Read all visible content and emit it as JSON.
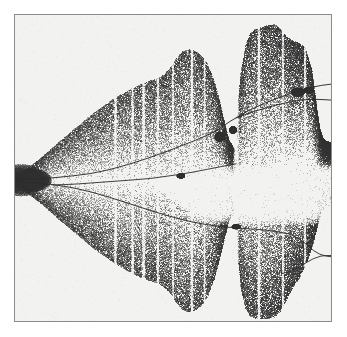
{
  "figure": {
    "kind": "bifurcation-diagram",
    "width_px": 347,
    "height_px": 337,
    "page_background": "#ffffff",
    "plot_background": "#f2f2f0",
    "frame_border_color": "#8a8a8a",
    "ink_color": "#2b2b2b",
    "title": "",
    "caption": ""
  },
  "chart_data": {
    "type": "scatter",
    "title": "",
    "subtitle": "",
    "xlabel": "",
    "ylabel": "",
    "xlim": [
      0,
      1
    ],
    "ylim": [
      0,
      1
    ],
    "grid": false,
    "legend": null,
    "axis_ticks_visible": false,
    "render": {
      "point_color": "#303030",
      "point_size_px": 1,
      "total_points": 150000,
      "seed": 20240607,
      "density_gamma": 1.35
    },
    "envelope": {
      "comment": "Upper and lower boundary of the chaotic band in normalized plot coords; x 0..1 left-to-right, y 0..1 top-to-bottom.",
      "upper": [
        [
          0.0,
          0.52
        ],
        [
          0.02,
          0.512
        ],
        [
          0.045,
          0.498
        ],
        [
          0.07,
          0.478
        ],
        [
          0.1,
          0.452
        ],
        [
          0.13,
          0.424
        ],
        [
          0.16,
          0.398
        ],
        [
          0.19,
          0.372
        ],
        [
          0.22,
          0.346
        ],
        [
          0.25,
          0.32
        ],
        [
          0.28,
          0.298
        ],
        [
          0.31,
          0.276
        ],
        [
          0.34,
          0.258
        ],
        [
          0.37,
          0.24
        ],
        [
          0.4,
          0.226
        ],
        [
          0.43,
          0.214
        ],
        [
          0.455,
          0.206
        ],
        [
          0.47,
          0.196
        ],
        [
          0.49,
          0.175
        ],
        [
          0.51,
          0.142
        ],
        [
          0.53,
          0.12
        ],
        [
          0.55,
          0.112
        ],
        [
          0.57,
          0.118
        ],
        [
          0.59,
          0.132
        ],
        [
          0.61,
          0.16
        ],
        [
          0.63,
          0.215
        ],
        [
          0.65,
          0.29
        ],
        [
          0.665,
          0.36
        ],
        [
          0.678,
          0.41
        ],
        [
          0.69,
          0.432
        ],
        [
          0.7,
          0.44
        ],
        [
          0.705,
          0.3
        ],
        [
          0.715,
          0.19
        ],
        [
          0.73,
          0.1
        ],
        [
          0.745,
          0.06
        ],
        [
          0.76,
          0.046
        ],
        [
          0.78,
          0.04
        ],
        [
          0.8,
          0.034
        ],
        [
          0.82,
          0.03
        ],
        [
          0.84,
          0.045
        ],
        [
          0.86,
          0.072
        ],
        [
          0.88,
          0.085
        ],
        [
          0.9,
          0.092
        ],
        [
          0.92,
          0.11
        ],
        [
          0.94,
          0.18
        ],
        [
          0.955,
          0.3
        ],
        [
          0.965,
          0.37
        ],
        [
          0.975,
          0.402
        ],
        [
          0.985,
          0.412
        ],
        [
          1.0,
          0.418
        ]
      ],
      "lower": [
        [
          0.0,
          0.56
        ],
        [
          0.02,
          0.57
        ],
        [
          0.045,
          0.586
        ],
        [
          0.07,
          0.606
        ],
        [
          0.1,
          0.632
        ],
        [
          0.13,
          0.66
        ],
        [
          0.16,
          0.686
        ],
        [
          0.19,
          0.712
        ],
        [
          0.22,
          0.738
        ],
        [
          0.25,
          0.764
        ],
        [
          0.28,
          0.786
        ],
        [
          0.31,
          0.808
        ],
        [
          0.34,
          0.826
        ],
        [
          0.37,
          0.844
        ],
        [
          0.4,
          0.858
        ],
        [
          0.43,
          0.87
        ],
        [
          0.455,
          0.878
        ],
        [
          0.47,
          0.888
        ],
        [
          0.49,
          0.908
        ],
        [
          0.51,
          0.94
        ],
        [
          0.53,
          0.962
        ],
        [
          0.55,
          0.972
        ],
        [
          0.57,
          0.966
        ],
        [
          0.59,
          0.95
        ],
        [
          0.61,
          0.92
        ],
        [
          0.63,
          0.866
        ],
        [
          0.65,
          0.79
        ],
        [
          0.665,
          0.722
        ],
        [
          0.678,
          0.672
        ],
        [
          0.69,
          0.65
        ],
        [
          0.7,
          0.642
        ],
        [
          0.705,
          0.78
        ],
        [
          0.715,
          0.89
        ],
        [
          0.73,
          0.96
        ],
        [
          0.745,
          0.984
        ],
        [
          0.76,
          0.992
        ],
        [
          0.78,
          0.994
        ],
        [
          0.8,
          0.992
        ],
        [
          0.82,
          0.988
        ],
        [
          0.84,
          0.97
        ],
        [
          0.86,
          0.93
        ],
        [
          0.88,
          0.89
        ],
        [
          0.9,
          0.86
        ],
        [
          0.92,
          0.82
        ],
        [
          0.94,
          0.76
        ],
        [
          0.955,
          0.7
        ],
        [
          0.965,
          0.66
        ],
        [
          0.975,
          0.638
        ],
        [
          0.985,
          0.628
        ],
        [
          1.0,
          0.622
        ]
      ]
    },
    "periodic_windows": [
      {
        "x": 0.318,
        "half_width": 0.0055,
        "strength": 0.94
      },
      {
        "x": 0.372,
        "half_width": 0.005,
        "strength": 0.9
      },
      {
        "x": 0.407,
        "half_width": 0.006,
        "strength": 0.92
      },
      {
        "x": 0.452,
        "half_width": 0.0048,
        "strength": 0.88
      },
      {
        "x": 0.5,
        "half_width": 0.0042,
        "strength": 0.86
      },
      {
        "x": 0.56,
        "half_width": 0.0055,
        "strength": 0.93
      },
      {
        "x": 0.6,
        "half_width": 0.004,
        "strength": 0.82
      },
      {
        "x": 0.7,
        "half_width": 0.011,
        "strength": 0.98
      },
      {
        "x": 0.772,
        "half_width": 0.0055,
        "strength": 0.93
      },
      {
        "x": 0.848,
        "half_width": 0.0045,
        "strength": 0.85
      },
      {
        "x": 0.918,
        "half_width": 0.0048,
        "strength": 0.88
      }
    ],
    "inner_gap": {
      "comment": "Central near-empty wedge that opens toward the right between the two main orbit branches.",
      "x_start": 0.43,
      "top": [
        [
          0.43,
          0.54
        ],
        [
          0.46,
          0.532
        ],
        [
          0.5,
          0.522
        ],
        [
          0.545,
          0.51
        ],
        [
          0.59,
          0.498
        ],
        [
          0.62,
          0.492
        ],
        [
          0.65,
          0.488
        ],
        [
          0.68,
          0.486
        ],
        [
          0.7,
          0.486
        ]
      ],
      "bottom": [
        [
          0.43,
          0.548
        ],
        [
          0.46,
          0.572
        ],
        [
          0.5,
          0.608
        ],
        [
          0.545,
          0.648
        ],
        [
          0.59,
          0.672
        ],
        [
          0.62,
          0.682
        ],
        [
          0.65,
          0.688
        ],
        [
          0.68,
          0.69
        ],
        [
          0.7,
          0.69
        ]
      ]
    },
    "orbit_curves": [
      {
        "name": "upper-unstable-branch",
        "width_px": 1.0,
        "opacity": 0.95,
        "points": [
          [
            0.0,
            0.538
          ],
          [
            0.06,
            0.536
          ],
          [
            0.12,
            0.532
          ],
          [
            0.18,
            0.526
          ],
          [
            0.24,
            0.518
          ],
          [
            0.3,
            0.505
          ],
          [
            0.36,
            0.488
          ],
          [
            0.42,
            0.468
          ],
          [
            0.47,
            0.45
          ],
          [
            0.52,
            0.43
          ],
          [
            0.57,
            0.41
          ],
          [
            0.61,
            0.392
          ],
          [
            0.64,
            0.376
          ],
          [
            0.66,
            0.362
          ],
          [
            0.68,
            0.348
          ],
          [
            0.7,
            0.336
          ],
          [
            0.74,
            0.312
          ],
          [
            0.79,
            0.288
          ],
          [
            0.84,
            0.268
          ],
          [
            0.88,
            0.254
          ],
          [
            0.91,
            0.244
          ],
          [
            0.94,
            0.236
          ],
          [
            0.97,
            0.23
          ],
          [
            1.0,
            0.226
          ]
        ]
      },
      {
        "name": "lower-unstable-branch",
        "width_px": 1.0,
        "opacity": 0.95,
        "points": [
          [
            0.0,
            0.545
          ],
          [
            0.06,
            0.548
          ],
          [
            0.12,
            0.554
          ],
          [
            0.18,
            0.564
          ],
          [
            0.24,
            0.578
          ],
          [
            0.3,
            0.596
          ],
          [
            0.36,
            0.616
          ],
          [
            0.42,
            0.636
          ],
          [
            0.47,
            0.652
          ],
          [
            0.52,
            0.666
          ],
          [
            0.56,
            0.676
          ],
          [
            0.6,
            0.684
          ],
          [
            0.64,
            0.69
          ],
          [
            0.68,
            0.694
          ],
          [
            0.7,
            0.695
          ]
        ]
      },
      {
        "name": "mid-separatrix",
        "width_px": 1.0,
        "opacity": 0.9,
        "points": [
          [
            0.12,
            0.556
          ],
          [
            0.2,
            0.552
          ],
          [
            0.28,
            0.546
          ],
          [
            0.36,
            0.54
          ],
          [
            0.43,
            0.534
          ],
          [
            0.5,
            0.524
          ],
          [
            0.56,
            0.514
          ],
          [
            0.61,
            0.504
          ],
          [
            0.65,
            0.496
          ],
          [
            0.69,
            0.488
          ],
          [
            0.7,
            0.486
          ]
        ]
      },
      {
        "name": "upper-right-tail",
        "width_px": 1.0,
        "opacity": 0.95,
        "points": [
          [
            0.7,
            0.336
          ],
          [
            0.76,
            0.314
          ],
          [
            0.82,
            0.296
          ],
          [
            0.87,
            0.284
          ],
          [
            0.905,
            0.278
          ],
          [
            0.935,
            0.276
          ],
          [
            0.965,
            0.276
          ],
          [
            1.0,
            0.278
          ]
        ]
      },
      {
        "name": "lower-right-loop-upper",
        "width_px": 1.0,
        "opacity": 0.9,
        "points": [
          [
            0.7,
            0.696
          ],
          [
            0.76,
            0.7
          ],
          [
            0.82,
            0.706
          ],
          [
            0.87,
            0.716
          ],
          [
            0.9,
            0.732
          ],
          [
            0.925,
            0.752
          ],
          [
            0.945,
            0.77
          ],
          [
            0.965,
            0.782
          ],
          [
            0.985,
            0.788
          ],
          [
            1.0,
            0.79
          ]
        ]
      },
      {
        "name": "lower-right-loop-lower",
        "width_px": 1.0,
        "opacity": 0.9,
        "points": [
          [
            0.845,
            0.845
          ],
          [
            0.87,
            0.838
          ],
          [
            0.895,
            0.826
          ],
          [
            0.92,
            0.81
          ],
          [
            0.945,
            0.796
          ],
          [
            0.968,
            0.788
          ],
          [
            0.985,
            0.786
          ],
          [
            1.0,
            0.786
          ]
        ]
      }
    ],
    "dark_clusters": [
      {
        "cx": 0.02,
        "cy": 0.54,
        "rx": 0.075,
        "ry": 0.052,
        "density": 1.0
      },
      {
        "cx": 0.06,
        "cy": 0.54,
        "rx": 0.055,
        "ry": 0.036,
        "density": 0.95
      },
      {
        "cx": 0.648,
        "cy": 0.398,
        "rx": 0.016,
        "ry": 0.016,
        "density": 0.9
      },
      {
        "cx": 0.69,
        "cy": 0.376,
        "rx": 0.012,
        "ry": 0.012,
        "density": 0.8
      },
      {
        "cx": 0.525,
        "cy": 0.526,
        "rx": 0.013,
        "ry": 0.008,
        "density": 0.7
      },
      {
        "cx": 0.895,
        "cy": 0.252,
        "rx": 0.022,
        "ry": 0.014,
        "density": 0.92
      },
      {
        "cx": 0.93,
        "cy": 0.246,
        "rx": 0.016,
        "ry": 0.01,
        "density": 0.8
      },
      {
        "cx": 0.7,
        "cy": 0.692,
        "rx": 0.014,
        "ry": 0.008,
        "density": 0.6
      }
    ]
  }
}
